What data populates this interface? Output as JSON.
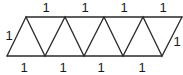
{
  "diagram": {
    "type": "triangle-strip",
    "colors": {
      "stroke": "#2a2a2a",
      "label": "#1a1a1a",
      "background": "#ffffff"
    },
    "labels": {
      "top": [
        "1",
        "1",
        "1",
        "1"
      ],
      "bottom": [
        "1",
        "1",
        "1",
        "1"
      ],
      "left": "1",
      "right": "1"
    }
  }
}
